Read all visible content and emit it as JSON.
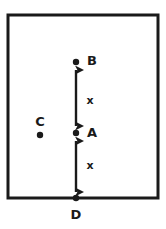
{
  "figure": {
    "colors": {
      "stroke": "#1a1a1a",
      "background": "#ffffff",
      "point_fill": "#1a1a1a"
    },
    "boundary": {
      "name": "rectangle-border",
      "x": 8,
      "y": 15,
      "width": 150,
      "height": 183,
      "stroke_width": 3
    },
    "points": [
      {
        "id": "B",
        "label": "B",
        "cx": 76,
        "cy": 62,
        "r": 3.2,
        "label_x": 92,
        "label_y": 61
      },
      {
        "id": "A",
        "label": "A",
        "cx": 76,
        "cy": 133,
        "r": 3.2,
        "label_x": 92,
        "label_y": 133
      },
      {
        "id": "C",
        "label": "C",
        "cx": 40,
        "cy": 135,
        "r": 3.2,
        "label_x": 40,
        "label_y": 122
      },
      {
        "id": "D",
        "label": "D",
        "cx": 76,
        "cy": 198,
        "r": 3.2,
        "label_x": 76,
        "label_y": 215
      }
    ],
    "measures": [
      {
        "id": "AB",
        "label": "x",
        "from": "B",
        "to": "A",
        "x": 76,
        "y1": 70,
        "y2": 126,
        "label_x": 90,
        "label_y": 101
      },
      {
        "id": "AD",
        "label": "x",
        "from": "A",
        "to": "D",
        "x": 76,
        "y1": 141,
        "y2": 192,
        "label_x": 90,
        "label_y": 166
      }
    ]
  }
}
